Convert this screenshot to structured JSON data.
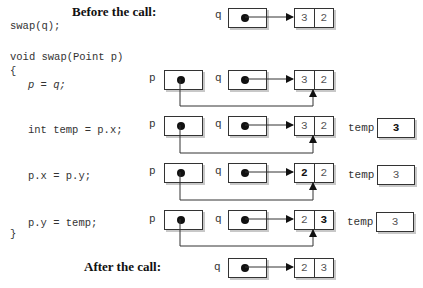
{
  "headings": {
    "before": "Before the call:",
    "after": "After the call:"
  },
  "code": {
    "call": "swap(q);",
    "signature": "void swap(Point p)",
    "open_brace": "{",
    "line1": "p = q;",
    "line2": "int temp = p.x;",
    "line3": "p.x = p.y;",
    "line4": "p.y = temp;",
    "close_brace": "}"
  },
  "labels": {
    "p": "p",
    "q": "q",
    "temp": "temp"
  },
  "states": [
    {
      "name": "before",
      "x": "3",
      "y": "2",
      "temp": null,
      "bold": ""
    },
    {
      "name": "after-assign",
      "x": "3",
      "y": "2",
      "temp": null,
      "bold": ""
    },
    {
      "name": "after-temp",
      "x": "3",
      "y": "2",
      "temp": "3",
      "bold": "temp"
    },
    {
      "name": "after-px",
      "x": "2",
      "y": "2",
      "temp": "3",
      "bold": "x"
    },
    {
      "name": "after-py",
      "x": "2",
      "y": "3",
      "temp": "3",
      "bold": "y"
    },
    {
      "name": "after-call",
      "x": "2",
      "y": "3",
      "temp": null,
      "bold": ""
    }
  ]
}
